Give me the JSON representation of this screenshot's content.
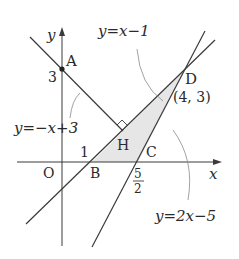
{
  "figure": {
    "axes": {
      "x_label": "x",
      "y_label": "y",
      "origin_label": "O"
    },
    "points": {
      "A": {
        "label": "A",
        "coords": [
          0,
          3
        ]
      },
      "B": {
        "label": "B",
        "coords": [
          1,
          0
        ]
      },
      "C": {
        "label": "C",
        "coords": [
          2.5,
          0
        ]
      },
      "D": {
        "label": "D",
        "coords": [
          4,
          3
        ],
        "coords_label": "(4, 3)"
      },
      "H": {
        "label": "H",
        "coords": [
          2,
          1
        ]
      }
    },
    "ticks": {
      "y3": "3",
      "x1": "1",
      "x_frac_num": "5",
      "x_frac_den": "2"
    },
    "lines": [
      {
        "name": "line-AH",
        "equation": "y=−x+3"
      },
      {
        "name": "line-BD",
        "equation": "y=x−1"
      },
      {
        "name": "line-CD",
        "equation": "y=2x−5"
      }
    ],
    "shaded_region": "triangle BCD",
    "right_angle_at": "H",
    "colors": {
      "line": "#3a3a3a",
      "shade": "#e6e6e6",
      "leader": "#8a8a8a"
    }
  }
}
